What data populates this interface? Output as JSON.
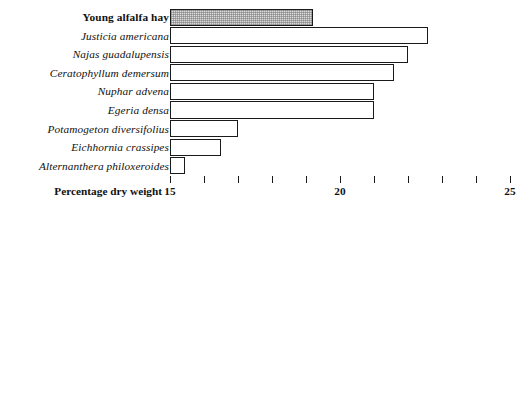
{
  "figure": {
    "background_color": "#ffffff",
    "bar_outline_color": "#1a1a1a",
    "highlight_fill_color": "#dcdcdc"
  },
  "charts": [
    {
      "id": "dry-weight",
      "axis_title": "Percentage dry weight",
      "tick_labels": [
        "15",
        "",
        "",
        "",
        "",
        "20",
        "",
        "",
        "",
        "",
        "25"
      ],
      "categories": [
        "Young alfalfa hay",
        "Justicia americana",
        "Najas guadalupensis",
        "Ceratophyllum demersum",
        "Nuphar advena",
        "Egeria densa",
        "Potamogeton diversifolius",
        "Eichhornia crassipes",
        "Alternanthera philoxeroides"
      ],
      "styles": [
        "upright",
        "italic",
        "italic",
        "italic",
        "italic",
        "italic",
        "italic",
        "italic",
        "italic"
      ],
      "values": [
        19.2,
        22.6,
        22.0,
        21.6,
        21.0,
        21.0,
        17.0,
        16.5,
        15.45
      ],
      "highlight_index": 0
    },
    {
      "id": "fresh-weight",
      "axis_title": "Percentage fresh weight",
      "tick_labels": [
        "0",
        "1",
        "2",
        "3",
        "4",
        "5"
      ],
      "categories": [
        "Young alfalfa hay",
        "Justicia americana",
        "Nuphar advena",
        "Alternanthera philoxeroides",
        "Egeria densa",
        "Najas quadalupensis",
        "Potamogeton diversifolius",
        "Eichhornia crassipes",
        "Ceratophyllum demersum"
      ],
      "styles": [
        "upright",
        "italic",
        "italic",
        "italic",
        "italic",
        "italic",
        "italic",
        "italic",
        "italic"
      ],
      "values": [
        4.66,
        3.53,
        2.64,
        2.39,
        2.27,
        1.89,
        1.89,
        1.15,
        1.15
      ],
      "highlight_index": 0
    }
  ],
  "chart_data": [
    {
      "type": "bar",
      "orientation": "horizontal",
      "title": "",
      "xlabel": "Percentage dry weight",
      "ylabel": "",
      "xlim": [
        15,
        25
      ],
      "xticks": [
        15,
        16,
        17,
        18,
        19,
        20,
        21,
        22,
        23,
        24,
        25
      ],
      "xticklabels": [
        "15",
        "",
        "",
        "",
        "",
        "20",
        "",
        "",
        "",
        "",
        "25"
      ],
      "grid": false,
      "legend": null,
      "categories": [
        "Young alfalfa hay",
        "Justicia americana",
        "Najas guadalupensis",
        "Ceratophyllum demersum",
        "Nuphar advena",
        "Egeria densa",
        "Potamogeton diversifolius",
        "Eichhornia crassipes",
        "Alternanthera philoxeroides"
      ],
      "values": [
        19.2,
        22.6,
        22.0,
        21.6,
        21.0,
        21.0,
        17.0,
        16.5,
        15.45
      ],
      "highlighted_category": "Young alfalfa hay",
      "notes": "Bars outlined in black; reference bar 'Young alfalfa hay' filled with light grey stipple."
    },
    {
      "type": "bar",
      "orientation": "horizontal",
      "title": "",
      "xlabel": "Percentage fresh weight",
      "ylabel": "",
      "xlim": [
        0,
        5
      ],
      "xticks": [
        0,
        1,
        2,
        3,
        4,
        5
      ],
      "xticklabels": [
        "0",
        "1",
        "2",
        "3",
        "4",
        "5"
      ],
      "grid": false,
      "legend": null,
      "categories": [
        "Young alfalfa hay",
        "Justicia americana",
        "Nuphar advena",
        "Alternanthera philoxeroides",
        "Egeria densa",
        "Najas quadalupensis",
        "Potamogeton diversifolius",
        "Eichhornia crassipes",
        "Ceratophyllum demersum"
      ],
      "values": [
        4.66,
        3.53,
        2.64,
        2.39,
        2.27,
        1.89,
        1.89,
        1.15,
        1.15
      ],
      "highlighted_category": "Young alfalfa hay",
      "notes": "Bars outlined in black; reference bar 'Young alfalfa hay' filled with light grey stipple."
    }
  ]
}
